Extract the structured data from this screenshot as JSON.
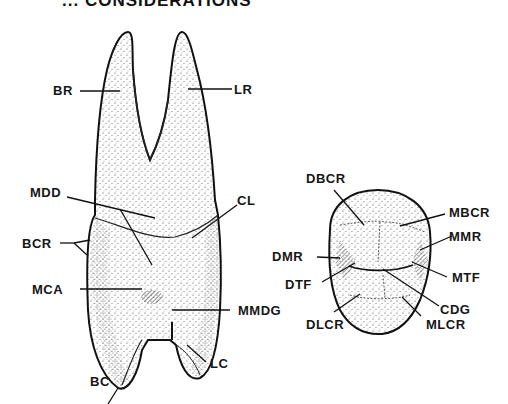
{
  "header": {
    "title": "... CONSIDERATIONS"
  },
  "figure_left": {
    "description": "Tooth, side view with two roots",
    "labels": {
      "br": "BR",
      "lr": "LR",
      "mdd": "MDD",
      "cl": "CL",
      "bcr": "BCR",
      "mca": "MCA",
      "mmdg": "MMDG",
      "lc": "LC",
      "bc": "BC"
    }
  },
  "figure_right": {
    "description": "Tooth, occlusal view",
    "labels": {
      "dbcr": "DBCR",
      "mbcr": "MBCR",
      "dmr": "DMR",
      "mmr": "MMR",
      "dtf": "DTF",
      "mtf": "MTF",
      "cdg": "CDG",
      "dlcr": "DLCR",
      "mlcr": "MLCR"
    }
  }
}
